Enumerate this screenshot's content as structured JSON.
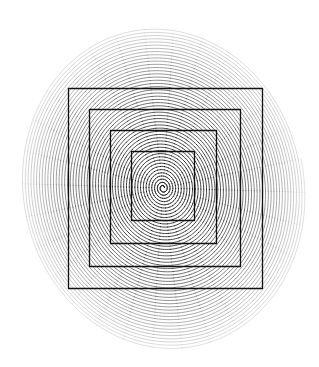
{
  "figure": {
    "title": "Elliptical spiral with concentric squares",
    "canvas": {
      "width": 319,
      "height": 367,
      "background": "#ffffff"
    },
    "spiral": {
      "name": "elliptical-archimedean-spiral",
      "center_x": 163,
      "center_y": 188,
      "turns": 50,
      "start_radius": 1.5,
      "end_radius_x": 141,
      "end_radius_y": 162,
      "ellipse_ratio_y_over_x": 1.15,
      "rotation_deg": -12,
      "direction": "counter-clockwise",
      "points_per_turn": 180,
      "line_width_inner": 0.85,
      "line_width_outer": 0.55,
      "color_inner": "#000000",
      "color_outer": "#c8c8c8",
      "extent_left": 20,
      "extent_right": 300,
      "extent_top": 23,
      "extent_bottom": 348
    },
    "squares": [
      {
        "name": "square-outer",
        "index": 1,
        "left": 68,
        "top": 88,
        "right": 262,
        "bottom": 288,
        "width": 194,
        "height": 200,
        "stroke": "#111111",
        "stroke_width": 1.3
      },
      {
        "name": "square-second",
        "index": 2,
        "left": 89,
        "top": 109,
        "right": 240,
        "bottom": 266,
        "width": 151,
        "height": 157,
        "stroke": "#111111",
        "stroke_width": 1.3
      },
      {
        "name": "square-third",
        "index": 3,
        "left": 110,
        "top": 130,
        "right": 216,
        "bottom": 243,
        "width": 106,
        "height": 113,
        "stroke": "#111111",
        "stroke_width": 1.3
      },
      {
        "name": "square-inner",
        "index": 4,
        "left": 131,
        "top": 151,
        "right": 194,
        "bottom": 220,
        "width": 63,
        "height": 69,
        "stroke": "#111111",
        "stroke_width": 1.3
      }
    ],
    "colors": {
      "ink": "#000000",
      "ink_faded": "#c8c8c8",
      "square_stroke": "#111111",
      "paper": "#ffffff"
    }
  }
}
